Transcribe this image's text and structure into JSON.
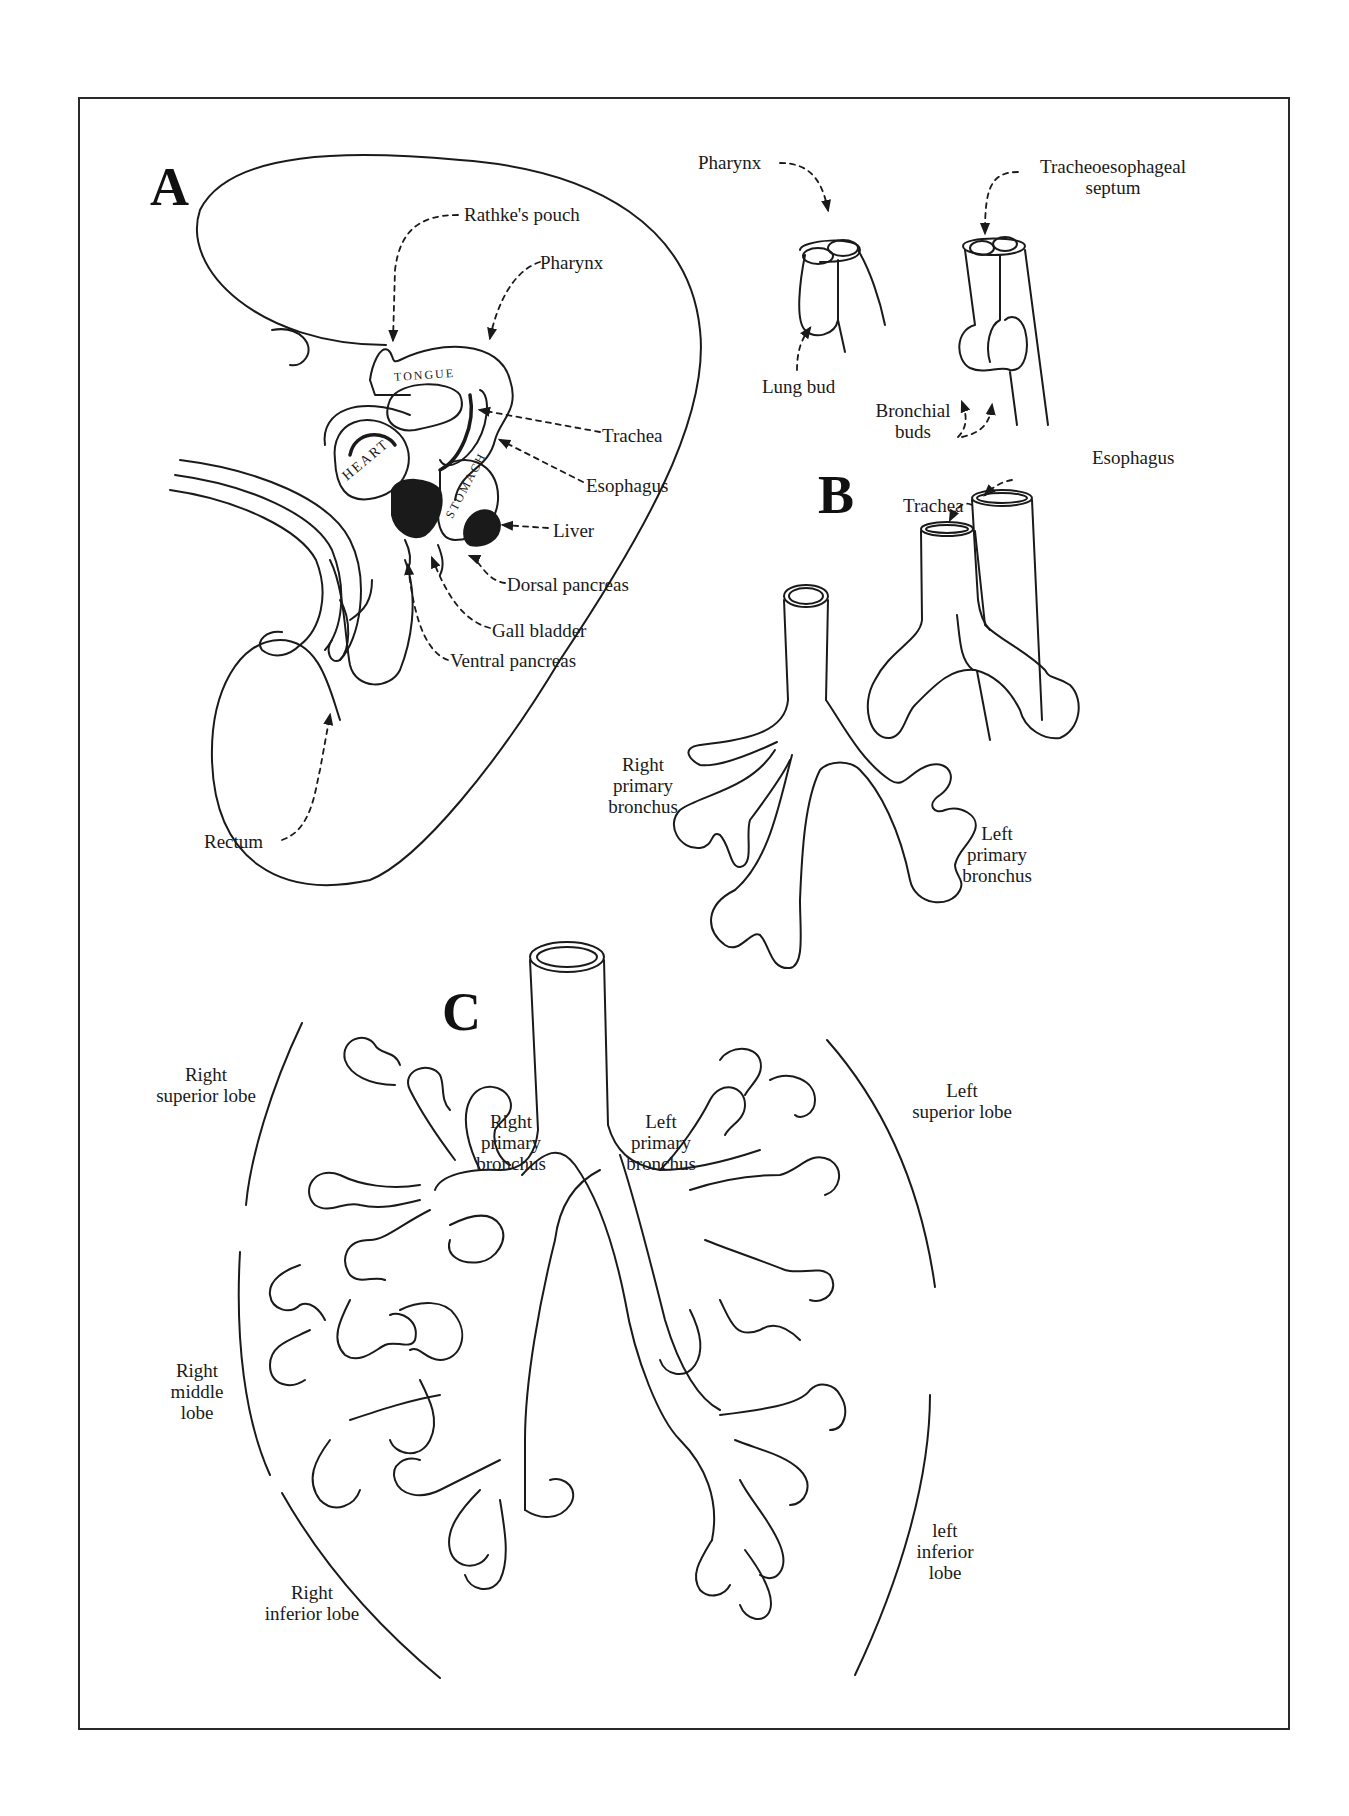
{
  "figure": {
    "panels": {
      "a": "A",
      "b": "B",
      "c": "C"
    },
    "panel_a": {
      "organ_text": {
        "tongue": "TONGUE",
        "heart": "HEART",
        "stomach": "STOMACH"
      },
      "labels": {
        "rathkes_pouch": "Rathke's pouch",
        "pharynx": "Pharynx",
        "trachea": "Trachea",
        "esophagus": "Esophagus",
        "liver": "Liver",
        "dorsal_pancreas": "Dorsal pancreas",
        "gall_bladder": "Gall bladder",
        "ventral_pancreas": "Ventral pancreas",
        "rectum": "Rectum"
      }
    },
    "panel_b": {
      "labels": {
        "pharynx": "Pharynx",
        "tracheoesophageal_septum_line1": "Tracheoesophageal",
        "tracheoesophageal_septum_line2": "septum",
        "lung_bud": "Lung bud",
        "bronchial_buds_line1": "Bronchial",
        "bronchial_buds_line2": "buds",
        "esophagus": "Esophagus",
        "trachea": "Trachea",
        "right_primary_bronchus": [
          "Right",
          "primary",
          "bronchus"
        ],
        "left_primary_bronchus": [
          "Left",
          "primary",
          "bronchus"
        ]
      }
    },
    "panel_c": {
      "labels": {
        "right_superior_lobe": [
          "Right",
          "superior lobe"
        ],
        "right_middle_lobe": [
          "Right",
          "middle",
          "lobe"
        ],
        "right_inferior_lobe": [
          "Right",
          "inferior lobe"
        ],
        "left_superior_lobe": [
          "Left",
          "superior lobe"
        ],
        "left_inferior_lobe": [
          "left",
          "inferior",
          "lobe"
        ],
        "right_primary_bronchus": [
          "Right",
          "primary",
          "bronchus"
        ],
        "left_primary_bronchus": [
          "Left",
          "primary",
          "bronchus"
        ]
      }
    }
  }
}
